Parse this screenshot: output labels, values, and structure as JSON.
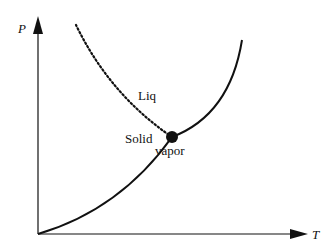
{
  "diagram": {
    "type": "phase-diagram",
    "axes": {
      "x_label": "T",
      "y_label": "P"
    },
    "regions": {
      "liquid": "Liq",
      "solid": "Solid",
      "vapor": "vapor"
    },
    "curves": [
      {
        "name": "fusion-curve",
        "style": "dotted",
        "description": "solid-liquid boundary"
      },
      {
        "name": "vaporization-curve",
        "style": "solid",
        "description": "liquid-vapor boundary"
      },
      {
        "name": "sublimation-curve",
        "style": "solid",
        "description": "solid-vapor boundary"
      }
    ],
    "special_points": [
      {
        "name": "triple-point",
        "marker": "filled-circle"
      }
    ],
    "colors": {
      "line": "#111111",
      "background": "#ffffff"
    }
  }
}
